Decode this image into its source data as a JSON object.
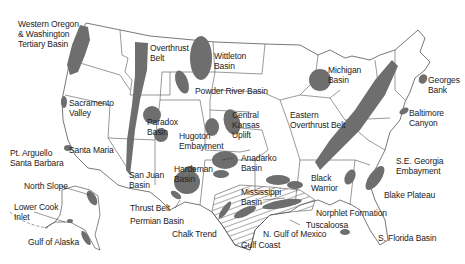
{
  "map": {
    "subject": "Oil and gas basins / exploration areas of the United States",
    "colors": {
      "land_fill": "#ffffff",
      "border": "#555555",
      "basin_fill": "#6e6e6e",
      "hatch": "#555555"
    },
    "labels": [
      {
        "id": "w-oregon",
        "text": "Western Oregon\n& Washington\nTertiary Basin",
        "x": 18,
        "y": 19
      },
      {
        "id": "overthrust",
        "text": "Overthrust\nBelt",
        "x": 150,
        "y": 43
      },
      {
        "id": "wittleton",
        "text": "Wittleton\nBasin",
        "x": 214,
        "y": 51
      },
      {
        "id": "powder-river",
        "text": "Powder River Basin",
        "x": 195,
        "y": 86
      },
      {
        "id": "michigan",
        "text": "Michigan\nBasin",
        "x": 328,
        "y": 65
      },
      {
        "id": "georges",
        "text": "Georges\nBank",
        "x": 428,
        "y": 75
      },
      {
        "id": "sacramento",
        "text": "Sacramento\nValley",
        "x": 69,
        "y": 98
      },
      {
        "id": "baltimore",
        "text": "Baltimore\nCanyon",
        "x": 409,
        "y": 108
      },
      {
        "id": "paradox",
        "text": "Paradox\nBasin",
        "x": 147,
        "y": 117
      },
      {
        "id": "central-kansas",
        "text": "Central\nKansas\nUplift",
        "x": 232,
        "y": 110
      },
      {
        "id": "eastern-overthrust",
        "text": "Eastern\nOverthrust Belt",
        "x": 290,
        "y": 110
      },
      {
        "id": "hugoton",
        "text": "Hugoton\nEmbayment",
        "x": 179,
        "y": 131
      },
      {
        "id": "santa-maria",
        "text": "Santa Maria",
        "x": 69,
        "y": 145
      },
      {
        "id": "pt-arguello",
        "text": "Pt. Arguello\nSanta Barbara",
        "x": 10,
        "y": 148
      },
      {
        "id": "anadarko",
        "text": "Anadarko\nBasin",
        "x": 241,
        "y": 153
      },
      {
        "id": "se-georgia",
        "text": "S.E. Georgia\nEmbayment",
        "x": 396,
        "y": 156
      },
      {
        "id": "north-slope",
        "text": "North Slope",
        "x": 24,
        "y": 181
      },
      {
        "id": "san-juan",
        "text": "San Juan\nBasin",
        "x": 129,
        "y": 170
      },
      {
        "id": "hardeman",
        "text": "Hardeman\nBasin",
        "x": 174,
        "y": 164
      },
      {
        "id": "black-warrior",
        "text": "Black\nWarrior",
        "x": 311,
        "y": 173
      },
      {
        "id": "blake-plateau",
        "text": "Blake Plateau",
        "x": 384,
        "y": 190
      },
      {
        "id": "mississippi",
        "text": "Mississippi\nBasin",
        "x": 241,
        "y": 187
      },
      {
        "id": "lower-cook",
        "text": "Lower Cook\nInlet",
        "x": 14,
        "y": 202
      },
      {
        "id": "thrust-belt",
        "text": "Thrust Belt",
        "x": 130,
        "y": 203
      },
      {
        "id": "norphlet",
        "text": "Norphlet Formation",
        "x": 316,
        "y": 208
      },
      {
        "id": "permian",
        "text": "Permian Basin",
        "x": 130,
        "y": 216
      },
      {
        "id": "tuscaloosa",
        "text": "Tuscaloosa",
        "x": 306,
        "y": 220
      },
      {
        "id": "chalk-trend",
        "text": "Chalk Trend",
        "x": 172,
        "y": 229
      },
      {
        "id": "n-gulf",
        "text": "N. Gulf of Mexico",
        "x": 263,
        "y": 229
      },
      {
        "id": "s-florida",
        "text": "S. Florida Basin",
        "x": 378,
        "y": 233
      },
      {
        "id": "gulf-coast",
        "text": "Gulf Coast",
        "x": 241,
        "y": 240
      },
      {
        "id": "gulf-alaska",
        "text": "Gulf of Alaska",
        "x": 28,
        "y": 237
      }
    ]
  }
}
